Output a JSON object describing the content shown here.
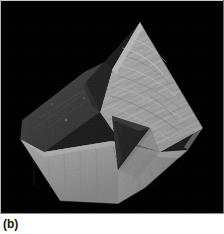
{
  "figure": {
    "caption": "(b)",
    "background_color": "#000000",
    "page_color": "#ffffff",
    "photo": {
      "width_px": 224,
      "height_px": 214,
      "border_color": "#c0c0c0"
    },
    "specimen": {
      "description": "cubic mineral crystal with striated faces and a triangular cleft",
      "faces": [
        {
          "name": "bright-striated-top-right-face",
          "tone": "#a9a9a9",
          "texture": "striated"
        },
        {
          "name": "dark-upper-left-face",
          "tone": "#2a2a2a",
          "texture": "matte"
        },
        {
          "name": "mid-gray-front-left-face",
          "tone": "#9a9a9a",
          "texture": "smooth"
        },
        {
          "name": "mid-gray-front-right-face",
          "tone": "#8c8c8c",
          "texture": "smooth"
        },
        {
          "name": "triangular-cleft-cavity",
          "tone": "#070707",
          "texture": "shadow"
        },
        {
          "name": "upper-notch-shadow",
          "tone": "#0b0b0b",
          "texture": "shadow"
        }
      ]
    }
  }
}
